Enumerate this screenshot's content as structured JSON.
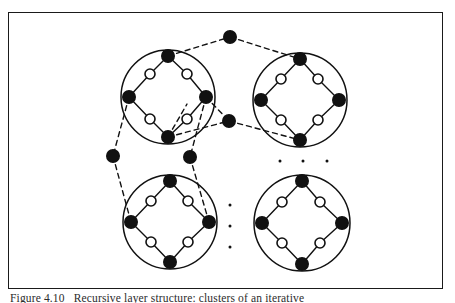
{
  "figure": {
    "caption_label": "Figure 4.10",
    "caption_text": "Recursive layer structure: clusters of an iterative",
    "frame": {
      "x": 8,
      "y": 12,
      "width": 435,
      "height": 277,
      "stroke": "#1a1a1a",
      "stroke_width": 1.6
    },
    "colors": {
      "ink": "#111111",
      "filled_node": "#111111",
      "hollow_node": "#ffffff",
      "background": "#ffffff",
      "solid_edge": "#111111",
      "dashed_edge": "#111111"
    },
    "geometry": {
      "filled_node_radius": 6.2,
      "hollow_node_radius": 5.0,
      "cluster_radius": 47,
      "node_stroke_width": 1.6,
      "edge_stroke_width": 1.4,
      "cluster_stroke_width": 1.5,
      "dash_pattern": "5,4"
    },
    "clusters": [
      {
        "name": "cluster-top-left",
        "cx": 168,
        "cy": 97,
        "r": 47,
        "corner_nodes": [
          {
            "name": "node-north",
            "x": 168,
            "y": 56,
            "type": "filled"
          },
          {
            "name": "node-east",
            "x": 206,
            "y": 97,
            "type": "filled"
          },
          {
            "name": "node-south",
            "x": 168,
            "y": 137,
            "type": "filled"
          },
          {
            "name": "node-west",
            "x": 129,
            "y": 97,
            "type": "filled"
          }
        ],
        "edge_nodes": [
          {
            "name": "node-nw-a",
            "x": 150,
            "y": 74,
            "type": "hollow"
          },
          {
            "name": "node-ne-a",
            "x": 187,
            "y": 74,
            "type": "hollow"
          },
          {
            "name": "node-se-a",
            "x": 187,
            "y": 119,
            "type": "hollow"
          },
          {
            "name": "node-sw-a",
            "x": 150,
            "y": 119,
            "type": "hollow"
          }
        ]
      },
      {
        "name": "cluster-top-right",
        "cx": 300,
        "cy": 100,
        "r": 47,
        "corner_nodes": [
          {
            "name": "node-north",
            "x": 300,
            "y": 59,
            "type": "filled"
          },
          {
            "name": "node-east",
            "x": 339,
            "y": 100,
            "type": "filled"
          },
          {
            "name": "node-south",
            "x": 300,
            "y": 140,
            "type": "filled"
          },
          {
            "name": "node-west",
            "x": 261,
            "y": 100,
            "type": "filled"
          }
        ],
        "edge_nodes": [
          {
            "name": "node-nw-a",
            "x": 281,
            "y": 79,
            "type": "hollow"
          },
          {
            "name": "node-ne-a",
            "x": 318,
            "y": 79,
            "type": "hollow"
          },
          {
            "name": "node-se-a",
            "x": 318,
            "y": 120,
            "type": "hollow"
          },
          {
            "name": "node-sw-a",
            "x": 281,
            "y": 120,
            "type": "hollow"
          }
        ]
      },
      {
        "name": "cluster-bottom-left",
        "cx": 170,
        "cy": 222,
        "r": 47,
        "corner_nodes": [
          {
            "name": "node-north",
            "x": 170,
            "y": 181,
            "type": "filled"
          },
          {
            "name": "node-east",
            "x": 209,
            "y": 222,
            "type": "filled"
          },
          {
            "name": "node-south",
            "x": 170,
            "y": 262,
            "type": "filled"
          },
          {
            "name": "node-west",
            "x": 131,
            "y": 222,
            "type": "filled"
          }
        ],
        "edge_nodes": [
          {
            "name": "node-nw-a",
            "x": 151,
            "y": 201,
            "type": "hollow"
          },
          {
            "name": "node-ne-a",
            "x": 188,
            "y": 201,
            "type": "hollow"
          },
          {
            "name": "node-se-a",
            "x": 188,
            "y": 242,
            "type": "hollow"
          },
          {
            "name": "node-sw-a",
            "x": 151,
            "y": 242,
            "type": "hollow"
          }
        ]
      },
      {
        "name": "cluster-bottom-right",
        "cx": 302,
        "cy": 223,
        "r": 48,
        "corner_nodes": [
          {
            "name": "node-north",
            "x": 302,
            "y": 181,
            "type": "filled"
          },
          {
            "name": "node-east",
            "x": 342,
            "y": 223,
            "type": "filled"
          },
          {
            "name": "node-south",
            "x": 302,
            "y": 264,
            "type": "filled"
          },
          {
            "name": "node-west",
            "x": 262,
            "y": 223,
            "type": "filled"
          }
        ],
        "edge_nodes": [
          {
            "name": "node-nw-a",
            "x": 282,
            "y": 202,
            "type": "hollow"
          },
          {
            "name": "node-ne-a",
            "x": 320,
            "y": 202,
            "type": "hollow"
          },
          {
            "name": "node-se-a",
            "x": 320,
            "y": 243,
            "type": "hollow"
          },
          {
            "name": "node-sw-a",
            "x": 282,
            "y": 243,
            "type": "hollow"
          }
        ]
      }
    ],
    "bridge_nodes": [
      {
        "name": "bridge-node-top",
        "x": 230,
        "y": 37,
        "type": "filled"
      },
      {
        "name": "bridge-node-middle",
        "x": 229,
        "y": 121,
        "type": "filled"
      },
      {
        "name": "bridge-node-left",
        "x": 113,
        "y": 156,
        "type": "filled"
      },
      {
        "name": "bridge-node-mid-right",
        "x": 190,
        "y": 157,
        "type": "filled"
      }
    ],
    "dashed_edges": [
      {
        "name": "edge-topleft-north-to-bridge-top",
        "x1": 168,
        "y1": 56,
        "x2": 230,
        "y2": 37
      },
      {
        "name": "edge-bridge-top-to-topright-north",
        "x1": 230,
        "y1": 37,
        "x2": 300,
        "y2": 59
      },
      {
        "name": "edge-topleft-east-to-bridge-middle",
        "x1": 206,
        "y1": 97,
        "x2": 229,
        "y2": 121
      },
      {
        "name": "edge-bridge-middle-to-topright-south",
        "x1": 229,
        "y1": 121,
        "x2": 300,
        "y2": 140
      },
      {
        "name": "edge-topleft-south-to-bridge-middle",
        "x1": 168,
        "y1": 137,
        "x2": 229,
        "y2": 121
      },
      {
        "name": "edge-topleft-west-to-bridge-left",
        "x1": 129,
        "y1": 97,
        "x2": 113,
        "y2": 156
      },
      {
        "name": "edge-bridge-left-to-bottomleft-west",
        "x1": 113,
        "y1": 156,
        "x2": 131,
        "y2": 222
      },
      {
        "name": "edge-topleft-east-to-bridge-midright",
        "x1": 206,
        "y1": 97,
        "x2": 190,
        "y2": 157
      },
      {
        "name": "edge-bridge-midright-to-bottomleft-east",
        "x1": 190,
        "y1": 157,
        "x2": 209,
        "y2": 222
      },
      {
        "name": "edge-topleft-south-to-midright-path",
        "x1": 168,
        "y1": 137,
        "x2": 187,
        "y2": 104
      }
    ],
    "ellipsis_horizontal": {
      "name": "ellipsis-horizontal",
      "dots": [
        {
          "x": 280,
          "y": 161
        },
        {
          "x": 303,
          "y": 161
        },
        {
          "x": 327,
          "y": 161
        }
      ],
      "radius": 1.5
    },
    "ellipsis_vertical": {
      "name": "ellipsis-vertical",
      "dots": [
        {
          "x": 230,
          "y": 205
        },
        {
          "x": 230,
          "y": 226
        },
        {
          "x": 230,
          "y": 247
        }
      ],
      "radius": 1.5
    }
  }
}
